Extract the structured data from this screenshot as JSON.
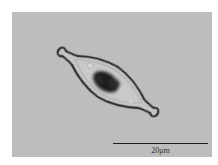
{
  "image": {
    "subject": "diatom cell micrograph",
    "background_color": "#bdbdbd",
    "outline_color": "#2a2a2a",
    "chloroplast_color": "#1c1c1c"
  },
  "scale_bar": {
    "label": "20μm"
  }
}
